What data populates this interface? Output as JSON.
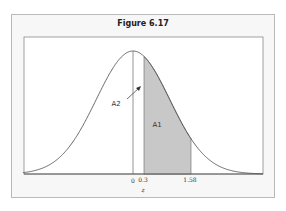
{
  "chart_data": {
    "type": "area",
    "title": "Figure 6.17",
    "xlabel": "z",
    "ylabel": "",
    "distribution": "standard normal",
    "x_ticks": [
      {
        "value": 0,
        "label": "0"
      },
      {
        "value": 0.3,
        "label": "0.3"
      },
      {
        "value": 1.58,
        "label": "1.58"
      }
    ],
    "shaded_region": {
      "from": 0.3,
      "to": 1.58
    },
    "annotations": [
      {
        "text": "A1",
        "description": "shaded area between z=0.3 and z=1.58"
      },
      {
        "text": "A2",
        "description": "area between z=0 and z=0.3, indicated by arrow"
      }
    ],
    "xlim": [
      -3.5,
      3.5
    ],
    "grid": false,
    "legend": "none"
  },
  "figure": {
    "title": "Figure 6.17",
    "xlabel": "z",
    "ticks": {
      "zero": "0",
      "a": "0.3",
      "b": "1.58"
    },
    "labels": {
      "a1": "A1",
      "a2": "A2"
    }
  },
  "colors": {
    "shade": "#c8c8c8",
    "curve": "#444444",
    "frame": "#b9b9b9",
    "background": "#f7f7f7"
  }
}
